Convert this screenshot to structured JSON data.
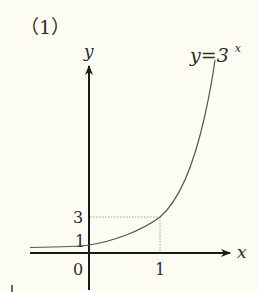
{
  "problem_label": "（1）",
  "axes": {
    "x_label": "x",
    "y_label": "y",
    "origin_label": "0"
  },
  "function_label": {
    "base": "y=3",
    "exponent": "x"
  },
  "ticks": {
    "x_tick": "1",
    "y_tick_1": "1",
    "y_tick_3": "3"
  },
  "colors": {
    "axis": "#1a1a1a",
    "curve": "#555555",
    "guide": "#888888",
    "background": "#fdfcf3"
  }
}
